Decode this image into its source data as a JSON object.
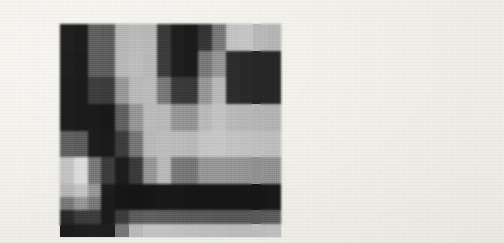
{
  "figure": {
    "background_color": "#f2f0ea",
    "panel_count": 2,
    "grid_rows": 16,
    "grid_cols": 16,
    "panels": [
      {
        "name": "left-panel",
        "label": "",
        "grayscale_matrix": [
          [
            31,
            28,
            96,
            92,
            183,
            186,
            184,
            58,
            30,
            26,
            52,
            120,
            196,
            198,
            186,
            182
          ],
          [
            31,
            28,
            96,
            94,
            183,
            188,
            186,
            58,
            30,
            26,
            54,
            120,
            196,
            198,
            186,
            182
          ],
          [
            30,
            27,
            95,
            93,
            185,
            190,
            186,
            60,
            30,
            27,
            120,
            150,
            44,
            40,
            38,
            38
          ],
          [
            30,
            27,
            95,
            93,
            185,
            190,
            186,
            60,
            30,
            27,
            120,
            150,
            44,
            40,
            38,
            38
          ],
          [
            29,
            27,
            62,
            60,
            152,
            186,
            188,
            120,
            58,
            56,
            150,
            186,
            44,
            40,
            38,
            38
          ],
          [
            29,
            27,
            62,
            60,
            152,
            186,
            188,
            120,
            58,
            56,
            150,
            186,
            44,
            40,
            38,
            38
          ],
          [
            28,
            26,
            26,
            24,
            96,
            150,
            188,
            186,
            150,
            148,
            186,
            196,
            186,
            184,
            182,
            180
          ],
          [
            28,
            26,
            26,
            24,
            96,
            150,
            188,
            186,
            150,
            148,
            186,
            196,
            186,
            184,
            182,
            180
          ],
          [
            96,
            92,
            28,
            26,
            60,
            118,
            186,
            190,
            188,
            186,
            198,
            200,
            196,
            194,
            192,
            190
          ],
          [
            96,
            92,
            28,
            26,
            60,
            118,
            186,
            190,
            188,
            186,
            198,
            200,
            196,
            194,
            192,
            190
          ],
          [
            196,
            222,
            120,
            60,
            28,
            58,
            150,
            186,
            120,
            118,
            150,
            152,
            150,
            148,
            146,
            144
          ],
          [
            196,
            222,
            120,
            60,
            28,
            58,
            150,
            186,
            120,
            118,
            150,
            152,
            150,
            148,
            146,
            144
          ],
          [
            182,
            196,
            150,
            28,
            22,
            20,
            22,
            24,
            24,
            22,
            22,
            22,
            22,
            22,
            22,
            24
          ],
          [
            120,
            150,
            120,
            26,
            22,
            20,
            22,
            24,
            24,
            22,
            22,
            22,
            22,
            22,
            22,
            24
          ],
          [
            40,
            60,
            60,
            26,
            60,
            92,
            96,
            94,
            92,
            90,
            90,
            88,
            88,
            88,
            90,
            92
          ],
          [
            28,
            30,
            32,
            30,
            120,
            186,
            196,
            196,
            194,
            192,
            190,
            190,
            188,
            188,
            190,
            192
          ]
        ]
      },
      {
        "name": "right-panel",
        "label": "",
        "grayscale_matrix": [
          [
            30,
            28,
            120,
            150,
            186,
            188,
            56,
            28,
            26,
            90,
            150,
            196,
            198,
            186,
            184,
            182
          ],
          [
            30,
            28,
            120,
            150,
            186,
            188,
            56,
            28,
            26,
            90,
            150,
            196,
            198,
            186,
            184,
            182
          ],
          [
            30,
            27,
            118,
            150,
            188,
            190,
            58,
            28,
            26,
            120,
            150,
            60,
            44,
            40,
            40,
            40
          ],
          [
            30,
            27,
            118,
            150,
            188,
            190,
            58,
            28,
            26,
            120,
            150,
            60,
            44,
            40,
            40,
            40
          ],
          [
            29,
            27,
            90,
            120,
            186,
            190,
            120,
            56,
            54,
            150,
            186,
            44,
            40,
            38,
            38,
            38
          ],
          [
            29,
            27,
            90,
            120,
            186,
            190,
            120,
            56,
            54,
            150,
            186,
            44,
            40,
            38,
            38,
            38
          ],
          [
            28,
            26,
            28,
            92,
            150,
            190,
            188,
            150,
            148,
            186,
            196,
            186,
            184,
            182,
            180,
            180
          ],
          [
            28,
            26,
            28,
            92,
            150,
            190,
            188,
            150,
            148,
            186,
            196,
            186,
            184,
            182,
            180,
            180
          ],
          [
            120,
            96,
            28,
            60,
            120,
            188,
            190,
            188,
            186,
            198,
            200,
            196,
            194,
            192,
            190,
            190
          ],
          [
            120,
            96,
            28,
            60,
            120,
            188,
            190,
            188,
            186,
            198,
            200,
            196,
            194,
            192,
            190,
            190
          ],
          [
            222,
            196,
            60,
            28,
            58,
            150,
            186,
            120,
            118,
            150,
            152,
            150,
            148,
            146,
            144,
            144
          ],
          [
            222,
            196,
            60,
            28,
            58,
            150,
            186,
            120,
            118,
            150,
            152,
            150,
            148,
            146,
            144,
            144
          ],
          [
            196,
            150,
            28,
            22,
            20,
            22,
            24,
            24,
            22,
            22,
            22,
            22,
            22,
            22,
            24,
            24
          ],
          [
            150,
            120,
            26,
            22,
            20,
            22,
            24,
            24,
            22,
            22,
            22,
            22,
            22,
            22,
            24,
            24
          ],
          [
            60,
            60,
            26,
            60,
            92,
            96,
            94,
            92,
            90,
            90,
            88,
            88,
            88,
            90,
            92,
            92
          ],
          [
            30,
            32,
            30,
            120,
            186,
            196,
            196,
            194,
            192,
            190,
            190,
            188,
            188,
            190,
            192,
            192
          ]
        ]
      }
    ]
  }
}
